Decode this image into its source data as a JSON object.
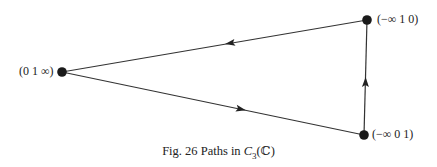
{
  "figure": {
    "caption_prefix": "Fig. 26 Paths in ",
    "caption_math": "C",
    "caption_sub": "3",
    "caption_suffix": "(ℂ)"
  },
  "nodes": [
    {
      "id": "left",
      "label": "(0 1 ∞)",
      "x": 62,
      "y": 72
    },
    {
      "id": "top_right",
      "label": "(−∞ 1 0)",
      "x": 367,
      "y": 20
    },
    {
      "id": "bottom_right",
      "label": "(−∞ 0 1)",
      "x": 364,
      "y": 135
    }
  ],
  "edges": [
    {
      "from": "top_right",
      "to": "left",
      "arrow": "toward-left"
    },
    {
      "from": "left",
      "to": "bottom_right",
      "arrow": "toward-bottom-right"
    },
    {
      "from": "bottom_right",
      "to": "top_right",
      "arrow": "upward"
    }
  ],
  "colors": {
    "stroke": "#333333",
    "node": "#1a1a1a"
  }
}
